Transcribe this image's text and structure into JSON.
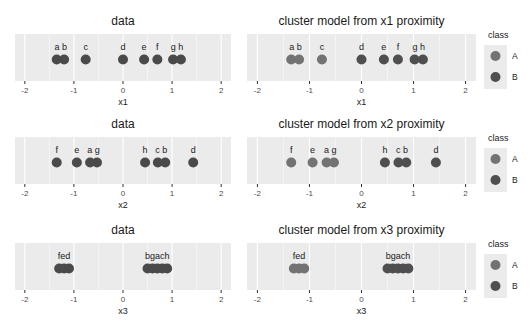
{
  "chart_data": [
    {
      "type": "scatter",
      "title": "data",
      "xlabel": "x1",
      "xlim": [
        -2.2,
        2.2
      ],
      "xticks": [
        -2,
        -1,
        0,
        1,
        2
      ],
      "tick_labels": [
        "-2",
        "-1",
        "0",
        "1",
        "2"
      ],
      "grid": true,
      "colored_by_class": false,
      "points": [
        {
          "label": "a",
          "x": -1.35
        },
        {
          "label": "b",
          "x": -1.2
        },
        {
          "label": "c",
          "x": -0.76
        },
        {
          "label": "d",
          "x": 0.0
        },
        {
          "label": "e",
          "x": 0.43
        },
        {
          "label": "f",
          "x": 0.7
        },
        {
          "label": "g",
          "x": 1.02
        },
        {
          "label": "h",
          "x": 1.18
        }
      ],
      "point_label_groups": [
        {
          "text": "a b",
          "x": -1.27
        },
        {
          "text": "c",
          "x": -0.76
        },
        {
          "text": "d",
          "x": 0.0
        },
        {
          "text": "e",
          "x": 0.43
        },
        {
          "text": "f",
          "x": 0.7
        },
        {
          "text": "g h",
          "x": 1.1
        }
      ]
    },
    {
      "type": "scatter",
      "title": "cluster model from x1 proximity",
      "xlabel": "x1",
      "xlim": [
        -2.2,
        2.2
      ],
      "xticks": [
        -2,
        -1,
        0,
        1,
        2
      ],
      "tick_labels": [
        "-2",
        "-1",
        "0",
        "1",
        "2"
      ],
      "grid": true,
      "colored_by_class": true,
      "points": [
        {
          "label": "a",
          "x": -1.35,
          "class": "A"
        },
        {
          "label": "b",
          "x": -1.2,
          "class": "A"
        },
        {
          "label": "c",
          "x": -0.76,
          "class": "A"
        },
        {
          "label": "d",
          "x": 0.0,
          "class": "B"
        },
        {
          "label": "e",
          "x": 0.43,
          "class": "B"
        },
        {
          "label": "f",
          "x": 0.7,
          "class": "B"
        },
        {
          "label": "g",
          "x": 1.02,
          "class": "B"
        },
        {
          "label": "h",
          "x": 1.18,
          "class": "B"
        }
      ],
      "point_label_groups": [
        {
          "text": "a b",
          "x": -1.27
        },
        {
          "text": "c",
          "x": -0.76
        },
        {
          "text": "d",
          "x": 0.0
        },
        {
          "text": "e",
          "x": 0.43
        },
        {
          "text": "f",
          "x": 0.7
        },
        {
          "text": "g h",
          "x": 1.1
        }
      ]
    },
    {
      "type": "scatter",
      "title": "data",
      "xlabel": "x2",
      "xlim": [
        -2.2,
        2.2
      ],
      "xticks": [
        -2,
        -1,
        0,
        1,
        2
      ],
      "tick_labels": [
        "-2",
        "-1",
        "0",
        "1",
        "2"
      ],
      "grid": true,
      "colored_by_class": false,
      "points": [
        {
          "label": "f",
          "x": -1.35
        },
        {
          "label": "e",
          "x": -0.94
        },
        {
          "label": "a",
          "x": -0.67
        },
        {
          "label": "g",
          "x": -0.53
        },
        {
          "label": "h",
          "x": 0.45
        },
        {
          "label": "c",
          "x": 0.71
        },
        {
          "label": "b",
          "x": 0.86
        },
        {
          "label": "d",
          "x": 1.43
        }
      ],
      "point_label_groups": [
        {
          "text": "f",
          "x": -1.35
        },
        {
          "text": "e",
          "x": -0.94
        },
        {
          "text": "a g",
          "x": -0.6
        },
        {
          "text": "h",
          "x": 0.45
        },
        {
          "text": "c b",
          "x": 0.78
        },
        {
          "text": "d",
          "x": 1.43
        }
      ]
    },
    {
      "type": "scatter",
      "title": "cluster model from x2 proximity",
      "xlabel": "x2",
      "xlim": [
        -2.2,
        2.2
      ],
      "xticks": [
        -2,
        -1,
        0,
        1,
        2
      ],
      "tick_labels": [
        "-2",
        "-1",
        "0",
        "1",
        "2"
      ],
      "grid": true,
      "colored_by_class": true,
      "points": [
        {
          "label": "f",
          "x": -1.35,
          "class": "A"
        },
        {
          "label": "e",
          "x": -0.94,
          "class": "A"
        },
        {
          "label": "a",
          "x": -0.67,
          "class": "A"
        },
        {
          "label": "g",
          "x": -0.53,
          "class": "A"
        },
        {
          "label": "h",
          "x": 0.45,
          "class": "B"
        },
        {
          "label": "c",
          "x": 0.71,
          "class": "B"
        },
        {
          "label": "b",
          "x": 0.86,
          "class": "B"
        },
        {
          "label": "d",
          "x": 1.43,
          "class": "B"
        }
      ],
      "point_label_groups": [
        {
          "text": "f",
          "x": -1.35
        },
        {
          "text": "e",
          "x": -0.94
        },
        {
          "text": "a g",
          "x": -0.6
        },
        {
          "text": "h",
          "x": 0.45
        },
        {
          "text": "c b",
          "x": 0.78
        },
        {
          "text": "d",
          "x": 1.43
        }
      ]
    },
    {
      "type": "scatter",
      "title": "data",
      "xlabel": "x3",
      "xlim": [
        -2.2,
        2.2
      ],
      "xticks": [
        -2,
        -1,
        0,
        1,
        2
      ],
      "tick_labels": [
        "-2",
        "-1",
        "0",
        "1",
        "2"
      ],
      "grid": true,
      "colored_by_class": false,
      "points": [
        {
          "label": "f",
          "x": -1.3
        },
        {
          "label": "e",
          "x": -1.2
        },
        {
          "label": "d",
          "x": -1.1
        },
        {
          "label": "b",
          "x": 0.5
        },
        {
          "label": "g",
          "x": 0.6
        },
        {
          "label": "a",
          "x": 0.7
        },
        {
          "label": "c",
          "x": 0.8
        },
        {
          "label": "h",
          "x": 0.9
        }
      ],
      "point_label_groups": [
        {
          "text": "fed",
          "x": -1.2
        },
        {
          "text": "bgach",
          "x": 0.7
        }
      ]
    },
    {
      "type": "scatter",
      "title": "cluster model from x3 proximity",
      "xlabel": "x3",
      "xlim": [
        -2.2,
        2.2
      ],
      "xticks": [
        -2,
        -1,
        0,
        1,
        2
      ],
      "tick_labels": [
        "-2",
        "-1",
        "0",
        "1",
        "2"
      ],
      "grid": true,
      "colored_by_class": true,
      "points": [
        {
          "label": "f",
          "x": -1.3,
          "class": "A"
        },
        {
          "label": "e",
          "x": -1.2,
          "class": "A"
        },
        {
          "label": "d",
          "x": -1.1,
          "class": "A"
        },
        {
          "label": "b",
          "x": 0.5,
          "class": "B"
        },
        {
          "label": "g",
          "x": 0.6,
          "class": "B"
        },
        {
          "label": "a",
          "x": 0.7,
          "class": "B"
        },
        {
          "label": "c",
          "x": 0.8,
          "class": "B"
        },
        {
          "label": "h",
          "x": 0.9,
          "class": "B"
        }
      ],
      "point_label_groups": [
        {
          "text": "fed",
          "x": -1.2
        },
        {
          "text": "bgach",
          "x": 0.7
        }
      ]
    }
  ],
  "legend": {
    "title": "class",
    "placement": "right",
    "entries": [
      {
        "label": "A",
        "color": "#737373"
      },
      {
        "label": "B",
        "color": "#4f4f4f"
      }
    ]
  },
  "colors": {
    "unclassed_point": "#4a4a4a",
    "panel_background": "#ebebeb",
    "grid": "#ffffff"
  }
}
